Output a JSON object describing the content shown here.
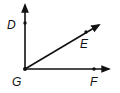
{
  "diagram": {
    "type": "geometry-angle-rays",
    "vertex": {
      "label": "G",
      "x": 25,
      "y": 69
    },
    "rays": [
      {
        "name": "GD",
        "point_label": "D",
        "point": {
          "x": 25,
          "y": 23
        },
        "arrow_tip": {
          "x": 25,
          "y": 4
        }
      },
      {
        "name": "GE",
        "point_label": "E",
        "point": {
          "x": 86,
          "y": 32
        },
        "arrow_tip": {
          "x": 100,
          "y": 24
        }
      },
      {
        "name": "GF",
        "point_label": "F",
        "point": {
          "x": 94,
          "y": 69
        },
        "arrow_tip": {
          "x": 110,
          "y": 69
        }
      }
    ],
    "labels": {
      "D": "D",
      "E": "E",
      "F": "F",
      "G": "G"
    },
    "colors": {
      "stroke": "#111111",
      "background": "#ffffff"
    }
  }
}
